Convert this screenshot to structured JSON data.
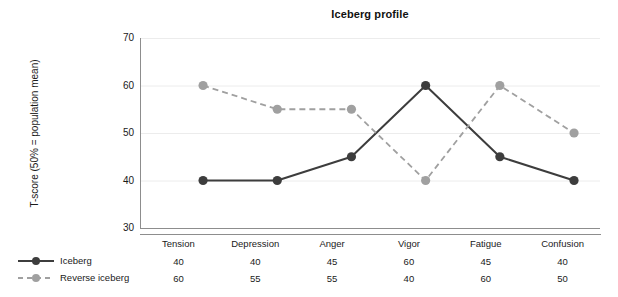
{
  "chart_data": {
    "type": "line",
    "title": "Iceberg profile",
    "xlabel": "",
    "ylabel": "T-score (50% = population mean)",
    "categories": [
      "Tension",
      "Depression",
      "Anger",
      "Vigor",
      "Fatigue",
      "Confusion"
    ],
    "series": [
      {
        "name": "Iceberg",
        "values": [
          40,
          40,
          45,
          60,
          45,
          40
        ],
        "color": "#3d3d3d",
        "linestyle": "solid",
        "marker": "circle"
      },
      {
        "name": "Reverse iceberg",
        "values": [
          60,
          55,
          55,
          40,
          60,
          50
        ],
        "color": "#a0a0a0",
        "linestyle": "dashed",
        "marker": "circle"
      }
    ],
    "ylim": [
      30,
      70
    ],
    "yticks": [
      30,
      40,
      50,
      60,
      70
    ],
    "ytick_labels": [
      "30",
      "40",
      "50",
      "60",
      "70"
    ],
    "grid": true,
    "grid_color": "#ececec",
    "legend_position": "bottom-left",
    "table_below": true
  },
  "axis": {
    "tick_labels": [
      "70",
      "60",
      "50",
      "40",
      "30"
    ]
  },
  "legend": {
    "items": [
      {
        "label": "Iceberg"
      },
      {
        "label": "Reverse iceberg"
      }
    ]
  },
  "table": {
    "headers": [
      "Tension",
      "Depression",
      "Anger",
      "Vigor",
      "Fatigue",
      "Confusion"
    ],
    "rows": [
      [
        "40",
        "40",
        "45",
        "60",
        "45",
        "40"
      ],
      [
        "60",
        "55",
        "55",
        "40",
        "60",
        "50"
      ]
    ]
  }
}
